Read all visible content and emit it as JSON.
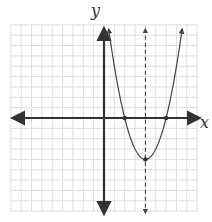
{
  "chart_data": {
    "type": "line",
    "title": "",
    "xlabel": "x",
    "ylabel": "y",
    "xlim": [
      -9,
      9
    ],
    "ylim": [
      -9,
      9
    ],
    "grid": true,
    "function": {
      "expression": "y = (x - 2)(x - 6)",
      "a": 1,
      "b": -8,
      "c": 12
    },
    "marked_points": [
      {
        "name": "root-left",
        "x": 2,
        "y": 0
      },
      {
        "name": "root-right",
        "x": 6,
        "y": 0
      },
      {
        "name": "vertex",
        "x": 4,
        "y": -4
      }
    ],
    "axis_of_symmetry": {
      "x": 4,
      "style": "dashed"
    }
  },
  "colors": {
    "grid": "#dedede",
    "axis": "#333333",
    "curve": "#444444",
    "dashed_line": "#444444"
  }
}
